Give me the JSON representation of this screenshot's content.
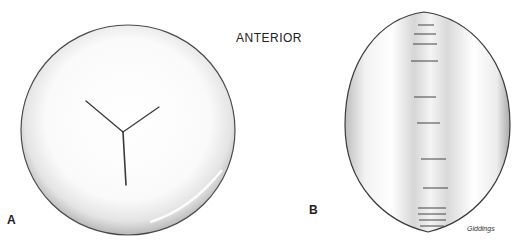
{
  "figure": {
    "orientation_label": "ANTERIOR",
    "panels": [
      {
        "label": "A",
        "description": "Anterior view of lens with Y-shaped suture"
      },
      {
        "label": "B",
        "description": "Side/equatorial view of lens with horizontal striations"
      }
    ],
    "signature": "Giddings"
  },
  "colors": {
    "background": "#ffffff",
    "outline": "#3a3a3a",
    "shade": "#bdbdbd"
  }
}
